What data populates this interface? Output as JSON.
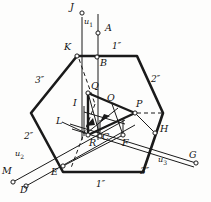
{
  "figure": {
    "background": "#fdfdfc",
    "line_color": "#1a1a1a",
    "points": [
      {
        "id": "J",
        "label": "J",
        "x": 82,
        "y": 13,
        "lx": 72,
        "ly": 4,
        "marker": true
      },
      {
        "id": "A",
        "label": "A",
        "x": 98,
        "y": 33,
        "lx": 106,
        "ly": 25,
        "marker": true
      },
      {
        "id": "K",
        "label": "K",
        "x": 77,
        "y": 56,
        "lx": 66,
        "ly": 44,
        "marker": true
      },
      {
        "id": "B",
        "label": "B",
        "x": 97,
        "y": 57,
        "lx": 101,
        "ly": 60,
        "marker": false
      },
      {
        "id": "Q",
        "label": "Q",
        "x": 88,
        "y": 93,
        "lx": 92,
        "ly": 83,
        "marker": true
      },
      {
        "id": "I",
        "label": "I",
        "x": 84,
        "y": 106,
        "lx": 74,
        "ly": 101,
        "marker": false
      },
      {
        "id": "O",
        "label": "O",
        "x": 112,
        "y": 104,
        "lx": 108,
        "ly": 95,
        "marker": false
      },
      {
        "id": "P",
        "label": "P",
        "x": 135,
        "y": 113,
        "lx": 136,
        "ly": 101,
        "marker": true
      },
      {
        "id": "L",
        "label": "L",
        "x": 75,
        "y": 126,
        "lx": 59,
        "ly": 120,
        "marker": false
      },
      {
        "id": "R",
        "label": "R",
        "x": 88,
        "y": 135,
        "lx": 90,
        "ly": 139,
        "marker": true
      },
      {
        "id": "C",
        "label": "C",
        "x": 100,
        "y": 136,
        "lx": 103,
        "ly": 134,
        "marker": true
      },
      {
        "id": "F",
        "label": "F",
        "x": 123,
        "y": 135,
        "lx": 123,
        "ly": 139,
        "marker": true
      },
      {
        "id": "H",
        "label": "H",
        "x": 155,
        "y": 133,
        "lx": 161,
        "ly": 126,
        "marker": true
      },
      {
        "id": "G",
        "label": "G",
        "x": 196,
        "y": 163,
        "lx": 190,
        "ly": 152,
        "marker": true
      },
      {
        "id": "E",
        "label": "E",
        "x": 63,
        "y": 166,
        "lx": 53,
        "ly": 168,
        "marker": true
      },
      {
        "id": "M",
        "label": "M",
        "x": 13,
        "y": 182,
        "lx": 5,
        "ly": 168,
        "marker": true
      },
      {
        "id": "D",
        "label": "D",
        "x": 26,
        "y": 186,
        "lx": 22,
        "ly": 186,
        "marker": true
      }
    ],
    "axis_labels": [
      {
        "id": "u1",
        "text": "u",
        "sub": "1",
        "x": 86,
        "y": 20
      },
      {
        "id": "u2",
        "text": "u",
        "sub": "2",
        "x": 17,
        "y": 152
      },
      {
        "id": "u3",
        "text": "u",
        "sub": "3",
        "x": 160,
        "y": 158
      }
    ],
    "plane_labels": [
      {
        "id": "p1dd",
        "text": "1″",
        "x": 113,
        "y": 45
      },
      {
        "id": "p2dd",
        "text": "2″",
        "x": 152,
        "y": 78
      },
      {
        "id": "p3dd",
        "text": "3″",
        "x": 36,
        "y": 79
      },
      {
        "id": "p2d",
        "text": "2″",
        "x": 25,
        "y": 135
      },
      {
        "id": "p3d",
        "text": "3″",
        "x": 141,
        "y": 170
      },
      {
        "id": "p1d",
        "text": "1″",
        "x": 97,
        "y": 182
      }
    ],
    "hexagon": {
      "vertices": "77,56 137,56 163,113 143,172 63,172 31,113",
      "stroke_width": 2.6
    },
    "triangle": {
      "vertices": "88,93 135,113 88,135",
      "stroke_width": 2.4
    }
  }
}
